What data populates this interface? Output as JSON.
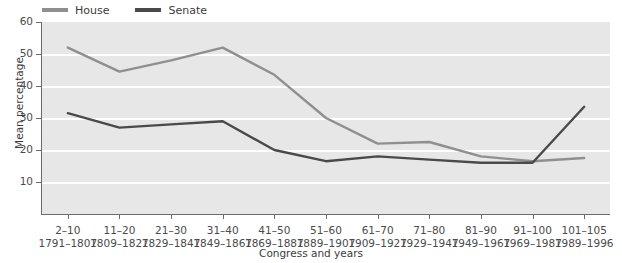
{
  "chart_data": {
    "type": "line",
    "title": "",
    "xlabel": "Congress and years",
    "ylabel": "Mean percentage",
    "ylim": [
      0,
      60
    ],
    "yticks": [
      10,
      20,
      30,
      40,
      50,
      60
    ],
    "grid": "horizontal-white-gridlines",
    "legend_position": "top-left",
    "categories": [
      "2–10",
      "11–20",
      "21–30",
      "31–40",
      "41–50",
      "51–60",
      "61–70",
      "71–80",
      "81–90",
      "91–100",
      "101–105"
    ],
    "category_years": [
      "1791–1807",
      "1809–1827",
      "1829–1847",
      "1849–1867",
      "1869–1887",
      "1889–1907",
      "1909–1927",
      "1929–1947",
      "1949–1967",
      "1969–1987",
      "1989–1996"
    ],
    "series": [
      {
        "name": "House",
        "color": "#8f8f8f",
        "values": [
          52,
          44.5,
          48,
          52,
          43.5,
          30,
          22,
          22.5,
          18,
          16.5,
          17.5
        ]
      },
      {
        "name": "Senate",
        "color": "#4a4a4a",
        "values": [
          31.5,
          27,
          28,
          29,
          20,
          16.5,
          18,
          17,
          16,
          16,
          33.5
        ]
      }
    ],
    "colors": {
      "plot_background": "#e7e7e7",
      "gridline": "#ffffff",
      "axis": "#6d6d6d",
      "house": "#8f8f8f",
      "senate": "#4a4a4a",
      "text": "#3c3c3c"
    }
  },
  "legend": {
    "items": [
      {
        "label": "House"
      },
      {
        "label": "Senate"
      }
    ]
  }
}
